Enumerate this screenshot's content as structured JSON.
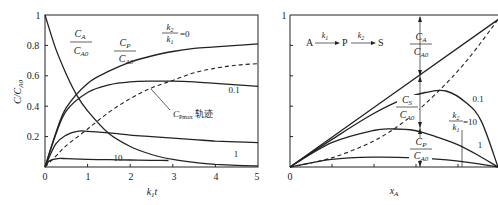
{
  "chart_data": [
    {
      "type": "line",
      "panel": "left",
      "title": "",
      "xlabel": "k1t",
      "ylabel": "C/CA0",
      "xlim": [
        0,
        5
      ],
      "ylim": [
        0,
        1
      ],
      "xticks": [
        "0",
        "1",
        "2",
        "3",
        "4",
        "5"
      ],
      "yticks": [
        "0.2",
        "0.4",
        "0.6",
        "0.8",
        "1"
      ],
      "grid": false,
      "annotations": [
        "CA/CA0",
        "CP/CA0",
        "k2/k1 = 0",
        "0.1",
        "1",
        "10",
        "CPmax 轨迹"
      ],
      "series": [
        {
          "name": "CA/CA0",
          "style": "solid",
          "x": [
            0,
            0.25,
            0.5,
            0.75,
            1,
            1.5,
            2,
            2.5,
            3,
            3.5,
            4,
            4.5,
            5
          ],
          "y": [
            1.0,
            0.78,
            0.61,
            0.47,
            0.37,
            0.22,
            0.135,
            0.082,
            0.05,
            0.03,
            0.018,
            0.011,
            0.007
          ]
        },
        {
          "name": "CP/CA0 k2/k1=0",
          "style": "solid",
          "x": [
            0,
            0.25,
            0.5,
            1,
            1.5,
            2,
            2.5,
            3,
            3.5,
            4,
            4.5,
            5
          ],
          "y": [
            0,
            0.22,
            0.39,
            0.55,
            0.63,
            0.69,
            0.73,
            0.76,
            0.78,
            0.79,
            0.8,
            0.81
          ]
        },
        {
          "name": "CP/CA0 k2/k1=0.1",
          "style": "solid",
          "x": [
            0,
            0.25,
            0.5,
            1,
            1.5,
            2,
            2.5,
            3,
            3.5,
            4,
            4.5,
            5
          ],
          "y": [
            0,
            0.21,
            0.37,
            0.49,
            0.54,
            0.56,
            0.565,
            0.565,
            0.56,
            0.55,
            0.54,
            0.53
          ]
        },
        {
          "name": "CP/CA0 k2/k1=1",
          "style": "solid",
          "x": [
            0,
            0.25,
            0.5,
            0.75,
            1,
            1.5,
            2,
            2.5,
            3,
            3.5,
            4,
            4.5,
            5
          ],
          "y": [
            0,
            0.15,
            0.21,
            0.235,
            0.235,
            0.225,
            0.21,
            0.2,
            0.19,
            0.18,
            0.17,
            0.165,
            0.16
          ]
        },
        {
          "name": "CP/CA0 k2/k1=10",
          "style": "solid",
          "x": [
            0,
            0.1,
            0.3,
            0.5,
            1,
            1.5,
            2,
            2.5,
            2.9
          ],
          "y": [
            0,
            0.04,
            0.055,
            0.055,
            0.05,
            0.048,
            0.046,
            0.044,
            0.043
          ]
        },
        {
          "name": "CPmax locus",
          "style": "dashed",
          "x": [
            0,
            0.25,
            0.5,
            1,
            1.5,
            2,
            2.5,
            3,
            3.5,
            4,
            4.5,
            5
          ],
          "y": [
            0,
            0.07,
            0.14,
            0.25,
            0.36,
            0.45,
            0.52,
            0.57,
            0.62,
            0.65,
            0.67,
            0.68
          ]
        }
      ]
    },
    {
      "type": "line",
      "panel": "right",
      "title": "A →(k1) P →(k2) S",
      "xlabel": "xA",
      "ylabel": "",
      "xlim": [
        0,
        1
      ],
      "ylim": [
        0,
        1
      ],
      "xticks": [
        "0"
      ],
      "yticks": [
        "1"
      ],
      "grid": false,
      "annotations": [
        "CA/CA0",
        "CS/CA0",
        "CP/CA0",
        "0.1",
        "1",
        "k2/k1 = 10"
      ],
      "series": [
        {
          "name": "xA line (k2/k1=0)",
          "style": "solid",
          "x": [
            0,
            1
          ],
          "y": [
            0,
            0.97
          ]
        },
        {
          "name": "CP/CA0 k2/k1=0.1",
          "style": "solid",
          "x": [
            0,
            0.2,
            0.4,
            0.55,
            0.65,
            0.75,
            0.85,
            0.92,
            1.0
          ],
          "y": [
            0,
            0.18,
            0.35,
            0.45,
            0.49,
            0.5,
            0.42,
            0.3,
            0.0
          ]
        },
        {
          "name": "CP/CA0 k2/k1=1",
          "style": "solid",
          "x": [
            0,
            0.2,
            0.4,
            0.5,
            0.6,
            0.7,
            0.8,
            0.9,
            1.0
          ],
          "y": [
            0,
            0.16,
            0.24,
            0.25,
            0.24,
            0.2,
            0.15,
            0.08,
            0.0
          ]
        },
        {
          "name": "CP/CA0 k2/k1=10",
          "style": "solid",
          "x": [
            0,
            0.2,
            0.4,
            0.6,
            0.8,
            1.0
          ],
          "y": [
            0,
            0.05,
            0.065,
            0.06,
            0.04,
            0.0
          ]
        },
        {
          "name": "CPmax locus",
          "style": "dashed",
          "x": [
            0,
            0.2,
            0.4,
            0.55,
            0.7,
            0.85,
            1.0
          ],
          "y": [
            0,
            0.06,
            0.17,
            0.3,
            0.48,
            0.7,
            0.97
          ]
        }
      ]
    }
  ],
  "left": {
    "ylabel": "C/C",
    "ylabel_sub": "A0",
    "xlabel": "k",
    "xlabel_sub": "1",
    "xlabel_t": "t",
    "xticks": [
      "0",
      "1",
      "2",
      "3",
      "4",
      "5"
    ],
    "yticks": [
      "0.2",
      "0.4",
      "0.6",
      "0.8",
      "1"
    ],
    "label_ca_num": "C",
    "label_ca_num_sub": "A",
    "label_ca_den": "C",
    "label_ca_den_sub": "A0",
    "label_cp_num": "C",
    "label_cp_num_sub": "P",
    "label_cp_den": "C",
    "label_cp_den_sub": "A0",
    "ratio_num": "k",
    "ratio_num_sub": "2",
    "ratio_den": "k",
    "ratio_den_sub": "1",
    "ratio_value": "=0",
    "label_01": "0.1",
    "label_1": "1",
    "label_10": "10",
    "locus_c": "C",
    "locus_sub": "Pmax",
    "locus_text": "轨迹"
  },
  "right": {
    "ytick_top": "1",
    "xtick_zero": "0",
    "xlabel": "x",
    "xlabel_sub": "A",
    "reaction_a": "A",
    "reaction_k1": "k",
    "reaction_k1_sub": "1",
    "reaction_p": "P",
    "reaction_k2": "k",
    "reaction_k2_sub": "2",
    "reaction_s": "S",
    "label_ca_num": "C",
    "label_ca_num_sub": "A",
    "label_ca_den": "C",
    "label_ca_den_sub": "A0",
    "label_cs_num": "C",
    "label_cs_num_sub": "S",
    "label_cs_den": "C",
    "label_cs_den_sub": "A0",
    "label_cp_num": "C",
    "label_cp_num_sub": "P",
    "label_cp_den": "C",
    "label_cp_den_sub": "A0",
    "ratio_num": "k",
    "ratio_num_sub": "2",
    "ratio_den": "k",
    "ratio_den_sub": "1",
    "ratio_value": "=10",
    "label_01": "0.1",
    "label_1": "1"
  }
}
